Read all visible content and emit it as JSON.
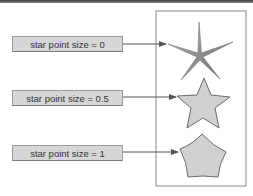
{
  "diagram": {
    "labels": [
      {
        "text": "star point size = 0",
        "star_point_size": 0
      },
      {
        "text": "star point size = 0.5",
        "star_point_size": 0.5
      },
      {
        "text": "star point size = 1",
        "star_point_size": 1
      }
    ],
    "colors": {
      "label_fill": "#d6d6d6",
      "label_border": "#9a9a9a",
      "shape_fill": "#d0d0d0",
      "shape_stroke": "#6a6a6a",
      "arrow": "#555555",
      "frame": "#8a8a8a"
    }
  }
}
